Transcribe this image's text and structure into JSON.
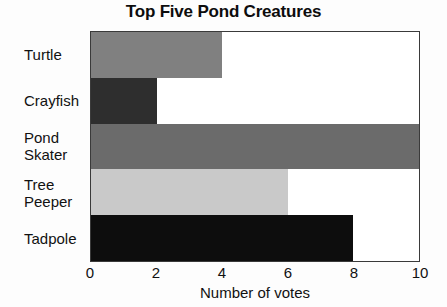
{
  "chart_data": {
    "type": "bar",
    "orientation": "horizontal",
    "title": "Top Five Pond Creatures",
    "xlabel": "Number of votes",
    "ylabel": "",
    "categories": [
      "Turtle",
      "Crayfish",
      "Pond\nSkater",
      "Tree\nPeeper",
      "Tadpole"
    ],
    "values": [
      4,
      2,
      10,
      6,
      8
    ],
    "bar_colors": [
      "#808080",
      "#2e2e2e",
      "#6b6b6b",
      "#c9c9c9",
      "#0d0d0d"
    ],
    "xlim": [
      0,
      10
    ],
    "xticks": [
      0,
      2,
      4,
      6,
      8,
      10
    ],
    "xtick_labels": [
      "0",
      "2",
      "4",
      "6",
      "8",
      "10"
    ],
    "grid": false,
    "legend": false,
    "plot_border_color": "#3a3a3a",
    "background_color": "#fdfdfd"
  }
}
